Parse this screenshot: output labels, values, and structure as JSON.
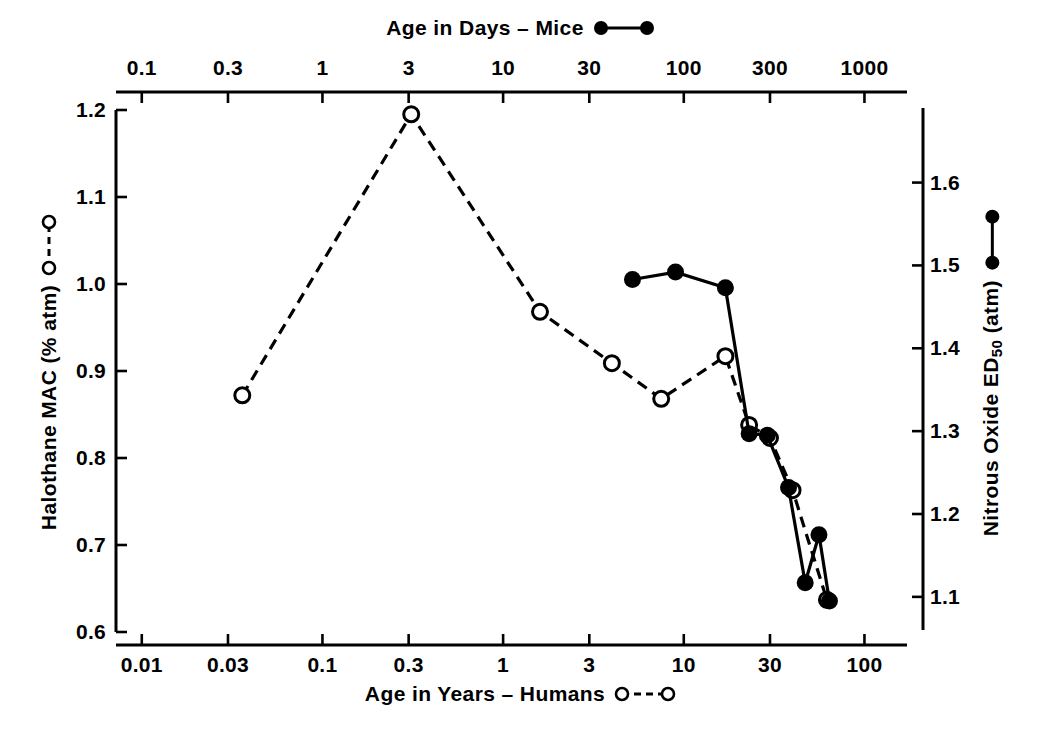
{
  "chart_data": {
    "type": "line",
    "title": "",
    "top_axis": {
      "label": "Age in Days – Mice",
      "scale": "log",
      "ticks": [
        "0.1",
        "0.3",
        "1",
        "3",
        "10",
        "30",
        "100",
        "300",
        "1000"
      ],
      "tick_values": [
        0.1,
        0.3,
        1,
        3,
        10,
        30,
        100,
        300,
        1000
      ],
      "range": [
        0.072,
        1720
      ]
    },
    "bottom_axis": {
      "label": "Age in Years – Humans",
      "scale": "log",
      "ticks": [
        "0.01",
        "0.03",
        "0.1",
        "0.3",
        "1",
        "3",
        "10",
        "30",
        "100"
      ],
      "tick_values": [
        0.01,
        0.03,
        0.1,
        0.3,
        1,
        3,
        10,
        30,
        100
      ],
      "range": [
        0.0072,
        172
      ]
    },
    "left_axis": {
      "label": "Halothane MAC (% atm)",
      "ticks": [
        "0.6",
        "0.7",
        "0.8",
        "0.9",
        "1.0",
        "1.1",
        "1.2"
      ],
      "tick_values": [
        0.6,
        0.7,
        0.8,
        0.9,
        1.0,
        1.1,
        1.2
      ],
      "range": [
        0.6,
        1.2
      ]
    },
    "right_axis": {
      "label_main": "Nitrous Oxide ED",
      "label_sub": "50",
      "label_tail": " (atm)",
      "label": "Nitrous Oxide ED50 (atm)",
      "ticks": [
        "1.1",
        "1.2",
        "1.3",
        "1.4",
        "1.5",
        "1.6"
      ],
      "tick_values": [
        1.1,
        1.2,
        1.3,
        1.4,
        1.5,
        1.6
      ],
      "range": [
        1.06,
        1.69
      ]
    },
    "grid": false,
    "legend_position": "axis-titles",
    "series": [
      {
        "name": "Age in Years – Humans",
        "marker": "open-circle",
        "line_style": "dashed",
        "axis": "left",
        "x_axis": "bottom",
        "points": [
          {
            "x": 0.036,
            "y": 0.872
          },
          {
            "x": 0.31,
            "y": 1.195
          },
          {
            "x": 1.6,
            "y": 0.968
          },
          {
            "x": 4.0,
            "y": 0.909
          },
          {
            "x": 7.5,
            "y": 0.868
          },
          {
            "x": 17.0,
            "y": 0.917
          },
          {
            "x": 23.0,
            "y": 0.838
          },
          {
            "x": 30.0,
            "y": 0.823
          },
          {
            "x": 40.0,
            "y": 0.763
          },
          {
            "x": 62.0,
            "y": 0.637
          }
        ]
      },
      {
        "name": "Age in Days – Mice",
        "marker": "filled-circle",
        "line_style": "solid",
        "axis": "right",
        "x_axis": "top",
        "points": [
          {
            "x": 52,
            "y": 1.483
          },
          {
            "x": 90,
            "y": 1.492
          },
          {
            "x": 170,
            "y": 1.473
          },
          {
            "x": 230,
            "y": 1.297
          },
          {
            "x": 290,
            "y": 1.295
          },
          {
            "x": 380,
            "y": 1.232
          },
          {
            "x": 470,
            "y": 1.117
          },
          {
            "x": 560,
            "y": 1.175
          },
          {
            "x": 640,
            "y": 1.095
          }
        ]
      }
    ],
    "legend": [
      {
        "label": "Age in Days – Mice",
        "marker": "filled-circle",
        "line_style": "solid"
      },
      {
        "label": "Age in Years – Humans",
        "marker": "open-circle",
        "line_style": "dashed"
      },
      {
        "label": "Halothane MAC (% atm)",
        "marker": "open-circle",
        "line_style": "dashed"
      },
      {
        "label": "Nitrous Oxide ED50 (atm)",
        "marker": "filled-circle",
        "line_style": "solid"
      }
    ],
    "colors": {
      "axis": "#000000",
      "series_human": "#000000",
      "series_mice": "#000000",
      "background": "#ffffff"
    }
  }
}
